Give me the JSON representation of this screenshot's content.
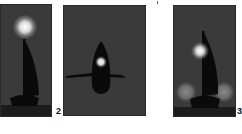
{
  "figure": {
    "panels": [
      {
        "id": "panel-1",
        "label": "",
        "description": "sailboat silhouette with bright light source above mast"
      },
      {
        "id": "panel-2",
        "label": "2",
        "description": "top-down hull silhouette with bright spot and horizontal oar/line"
      },
      {
        "id": "panel-3",
        "label": "3",
        "description": "sailboat silhouette with bright light near mast and two dim glows at sides"
      }
    ],
    "colors": {
      "background": "#3a3a3a",
      "silhouette": "#0a0a0a",
      "floor": "#1c1c1c",
      "glow": "#ffffff"
    }
  }
}
